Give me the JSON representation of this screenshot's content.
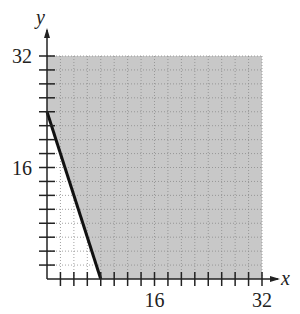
{
  "chart_data": {
    "type": "area",
    "title": "",
    "xlabel": "x",
    "ylabel": "y",
    "xlim": [
      0,
      32
    ],
    "ylim": [
      0,
      32
    ],
    "x_ticks_step": 2,
    "y_ticks_step": 2,
    "x_tick_labels": [
      {
        "value": 16,
        "label": "16"
      },
      {
        "value": 32,
        "label": "32"
      }
    ],
    "y_tick_labels": [
      {
        "value": 16,
        "label": "16"
      },
      {
        "value": 32,
        "label": "32"
      }
    ],
    "grid": true,
    "boundary_line": {
      "points": [
        [
          0,
          24
        ],
        [
          8,
          0
        ]
      ],
      "equation": "3x + y = 24",
      "style": "solid"
    },
    "shaded_region": {
      "description": "region above/right of boundary line within 0<=x<=32, 0<=y<=32",
      "inequality": "3x + y >= 24",
      "polygon": [
        [
          0,
          24
        ],
        [
          0,
          32
        ],
        [
          32,
          32
        ],
        [
          32,
          0
        ],
        [
          8,
          0
        ]
      ],
      "color": "#c8c8c8"
    }
  },
  "colors": {
    "shade": "#c8c8c8",
    "axis": "#222222",
    "grid": "#8a8a8a",
    "line": "#111111"
  }
}
